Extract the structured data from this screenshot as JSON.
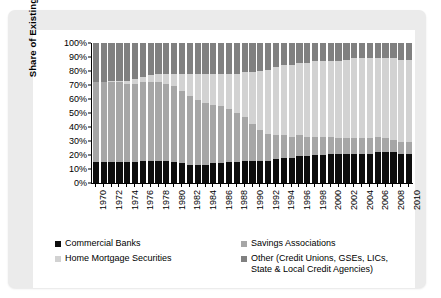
{
  "chart_data": {
    "type": "area",
    "subtype": "stacked-percent-column",
    "title": "",
    "xlabel": "",
    "ylabel": "Share of Existing Loans",
    "ylim": [
      0,
      100
    ],
    "ytick_labels": [
      "100%",
      "90%",
      "80%",
      "70%",
      "60%",
      "50%",
      "40%",
      "30%",
      "20%",
      "10%",
      "0%"
    ],
    "ytick_values": [
      100,
      90,
      80,
      70,
      60,
      50,
      40,
      30,
      20,
      10,
      0
    ],
    "grid": false,
    "legend_position": "bottom",
    "x": [
      1970,
      1971,
      1972,
      1973,
      1974,
      1975,
      1976,
      1977,
      1978,
      1979,
      1980,
      1981,
      1982,
      1983,
      1984,
      1985,
      1986,
      1987,
      1988,
      1989,
      1990,
      1991,
      1992,
      1993,
      1994,
      1995,
      1996,
      1997,
      1998,
      1999,
      2000,
      2001,
      2002,
      2003,
      2004,
      2005,
      2006,
      2007,
      2008,
      2009,
      2010
    ],
    "xtick_labels": [
      "1970",
      "1972",
      "1974",
      "1976",
      "1978",
      "1980",
      "1982",
      "1984",
      "1986",
      "1988",
      "1990",
      "1992",
      "1994",
      "1996",
      "1998",
      "2000",
      "2002",
      "2004",
      "2006",
      "2008",
      "2010"
    ],
    "series": [
      {
        "name": "Commercial Banks",
        "color": "#0d0d0d",
        "values": [
          15,
          15,
          15,
          15,
          15,
          15,
          16,
          16,
          16,
          16,
          15,
          14,
          13,
          13,
          13,
          14,
          14,
          15,
          15,
          16,
          16,
          16,
          16,
          17,
          18,
          18,
          19,
          19,
          20,
          20,
          21,
          21,
          21,
          21,
          21,
          21,
          22,
          22,
          22,
          21,
          21
        ]
      },
      {
        "name": "Savings Associations",
        "color": "#a6a6a6",
        "values": [
          57,
          57,
          57,
          57,
          56,
          56,
          56,
          56,
          56,
          55,
          54,
          52,
          49,
          46,
          44,
          42,
          41,
          38,
          35,
          31,
          26,
          22,
          19,
          17,
          16,
          15,
          15,
          14,
          13,
          13,
          12,
          11,
          11,
          11,
          11,
          11,
          11,
          10,
          9,
          8,
          8
        ]
      },
      {
        "name": "Home Mortgage Securities",
        "color": "#d2d2d2",
        "values": [
          0,
          0,
          1,
          1,
          2,
          3,
          4,
          5,
          6,
          7,
          9,
          12,
          16,
          19,
          21,
          22,
          23,
          25,
          28,
          32,
          37,
          42,
          46,
          49,
          50,
          51,
          52,
          53,
          54,
          54,
          54,
          55,
          56,
          57,
          57,
          57,
          56,
          57,
          58,
          59,
          59
        ]
      },
      {
        "name": "Other (Credit Unions, GSEs, LICs, State & Local Credit Agencies)",
        "color": "#808080",
        "values": [
          28,
          28,
          27,
          27,
          27,
          26,
          24,
          23,
          22,
          22,
          22,
          22,
          22,
          22,
          22,
          22,
          22,
          22,
          22,
          21,
          21,
          20,
          19,
          17,
          16,
          16,
          14,
          14,
          13,
          13,
          13,
          13,
          12,
          11,
          11,
          11,
          11,
          11,
          11,
          12,
          12
        ]
      }
    ]
  },
  "legend": {
    "items": [
      {
        "label": "Commercial Banks",
        "color": "#0d0d0d"
      },
      {
        "label": "Savings Associations",
        "color": "#a6a6a6"
      },
      {
        "label": "Home Mortgage Securities",
        "color": "#d2d2d2"
      },
      {
        "label": "Other (Credit Unions, GSEs, LICs,\nState & Local Credit Agencies)",
        "color": "#808080"
      }
    ]
  }
}
